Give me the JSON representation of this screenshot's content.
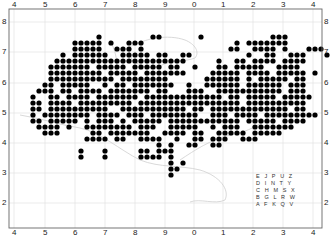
{
  "map": {
    "title": "",
    "frame_color": "#555555",
    "grid_color": "#dddddd",
    "coast_color": "#cccccc",
    "dot_color": "#000000",
    "x_labels": [
      "4",
      "5",
      "6",
      "7",
      "8",
      "9",
      "0",
      "1",
      "2",
      "3",
      "4"
    ],
    "y_labels": [
      "8",
      "7",
      "6",
      "5",
      "4",
      "3",
      "2"
    ],
    "dot_grid": {
      "x0": 15,
      "y0": 31,
      "pitch": 6,
      "radius": 2.6,
      "rows": [
        ".....................................................",
        "..............#........##......#...........###.......",
        "..........#####.#..###...............#.#######.......",
        "..........#####..###.#..............##..####.#...###.",
        "........#.######..#####.##..##.........#..##..###...#",
        ".......######################.....#..##.####.####....",
        "......#######.#####.#####.##..#...##.#####..####.....",
        "......#########.#####.#######....#####.####.#####.#..",
        "......###########.########......######.#.#####.##....",
        ".....##.#####..#.##.#######..#..######.######.###....",
        "....###.##.####.#######.##...###..###########.###....",
        "...#..##.####.#######.#############.##.#####.#####...",
        "...##.####.#########.#################.##########....",
        "...##.##########..###########.##.#############.##....",
        "...#.########.####.###.########..###.####.#########..",
        "...##.#####.#.###.#.#####.############.#####.####....",
        "....####.#..########.###..#####..#.###..#######......",
        ".....###.....##.#######..####.##..#####.#####........",
        "............####.##..####..#..##.###..###............",
        "........................#.#..##..##..................",
        "...........#...#.....##.###......................... ",
        "...........#...#.....####.#..........................",
        "..........................#.#........................",
        "..........................##.........................",
        "..........................#..........................",
        ".....................................................",
        ".....................................................",
        "....................................................."
      ]
    },
    "legend": {
      "rows": [
        "E J P U Z",
        "D I N T Y",
        "C H M S X",
        "B G L R W",
        "A F K Q V"
      ]
    }
  }
}
